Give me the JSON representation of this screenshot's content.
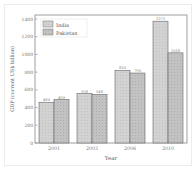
{
  "chart_data": {
    "type": "bar",
    "title": "",
    "xlabel": "Year",
    "ylabel": "GDP (current US$ billion)",
    "categories": [
      "2001",
      "2003",
      "2006",
      "2010"
    ],
    "series": [
      {
        "name": "India",
        "values": [
          460,
          558,
          820,
          1375
        ],
        "color": "#cfcfcf"
      },
      {
        "name": "Pakistan",
        "values": [
          490,
          548,
          790,
          1018
        ],
        "color": "#bdbdbd"
      }
    ],
    "ylim": [
      0,
      1400
    ],
    "yticks": [
      0,
      200,
      400,
      600,
      800,
      1000,
      1200,
      1400
    ],
    "grid": false,
    "legend_position": "upper left"
  },
  "labels": {
    "xlabel": "Year",
    "ylabel": "GDP (current US$ billion)",
    "legend": [
      "India",
      "Pakistan"
    ],
    "yticks": [
      "0",
      "200",
      "400",
      "600",
      "800",
      "1000",
      "1200",
      "1400"
    ],
    "xticks": [
      "2001",
      "2003",
      "2006",
      "2010"
    ],
    "bar_labels": [
      [
        "460",
        "490"
      ],
      [
        "558",
        "548"
      ],
      [
        "820",
        "790"
      ],
      [
        "1375",
        "1018"
      ]
    ]
  }
}
